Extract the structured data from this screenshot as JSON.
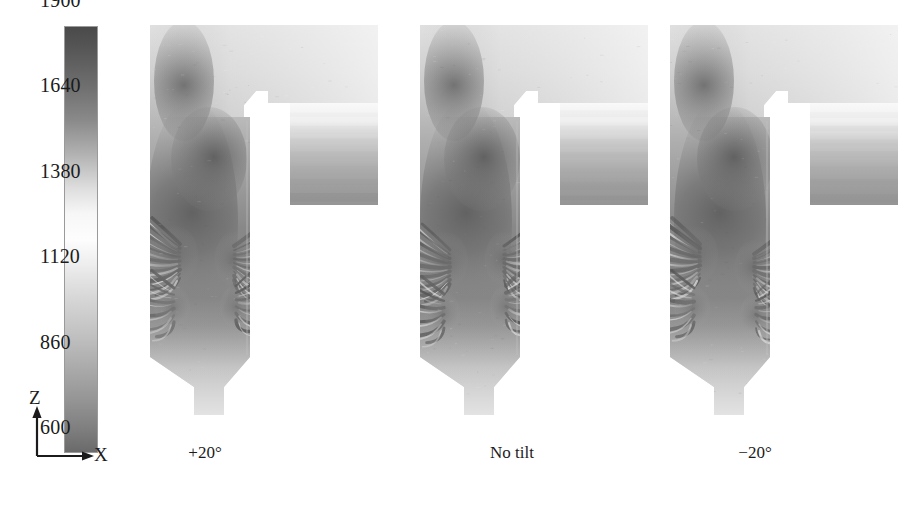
{
  "figure": {
    "type": "cfd-contour-panels",
    "background_color": "#ffffff",
    "text_color": "#1b1b1b"
  },
  "colorbar": {
    "name": "temperature-colorbar",
    "orientation": "vertical",
    "colormap": "grayscale-inverted-banded",
    "min": 600,
    "max": 1900,
    "tick_values": [
      1900,
      1640,
      1380,
      1120,
      860,
      600
    ],
    "tick_labels": [
      "1900",
      "1640",
      "1380",
      "1120",
      "860",
      "600"
    ],
    "stops": [
      {
        "pos": 0.0,
        "color": "#4a4a4a"
      },
      {
        "pos": 0.05,
        "color": "#565656"
      },
      {
        "pos": 0.14,
        "color": "#6f6f6f"
      },
      {
        "pos": 0.22,
        "color": "#8a8a8a"
      },
      {
        "pos": 0.3,
        "color": "#b2b2b2"
      },
      {
        "pos": 0.38,
        "color": "#dedede"
      },
      {
        "pos": 0.44,
        "color": "#f7f7f7"
      },
      {
        "pos": 0.5,
        "color": "#fdfdfd"
      },
      {
        "pos": 0.56,
        "color": "#ededed"
      },
      {
        "pos": 0.64,
        "color": "#d6d6d6"
      },
      {
        "pos": 0.72,
        "color": "#c2c2c2"
      },
      {
        "pos": 0.8,
        "color": "#ababab"
      },
      {
        "pos": 0.88,
        "color": "#949494"
      },
      {
        "pos": 0.95,
        "color": "#7d7d7d"
      },
      {
        "pos": 1.0,
        "color": "#6a6a6a"
      }
    ]
  },
  "axis_triad": {
    "name": "orientation-axes",
    "vertical_label": "Z",
    "horizontal_label": "X"
  },
  "panels": [
    {
      "id": "panel-plus20",
      "caption": "+20°",
      "tilt_degrees": 20,
      "description": "furnace cross-section temperature contour, burner tilted +20 degrees"
    },
    {
      "id": "panel-no-tilt",
      "caption": "No tilt",
      "tilt_degrees": 0,
      "description": "furnace cross-section temperature contour, no burner tilt"
    },
    {
      "id": "panel-minus20",
      "caption": "−20°",
      "tilt_degrees": -20,
      "description": "furnace cross-section temperature contour, burner tilted -20 degrees"
    }
  ],
  "chart_data": {
    "type": "heatmap",
    "title": "",
    "xlabel": "X",
    "ylabel": "Z",
    "colorbar_label": "",
    "colorbar_range": [
      600,
      1900
    ],
    "colorbar_ticks": [
      600,
      860,
      1120,
      1380,
      1640,
      1900
    ],
    "grid": false,
    "legend_position": "left",
    "panels": [
      {
        "name": "+20°",
        "regions": [
          {
            "zone": "upper furnace shaft",
            "approx_value": 1450
          },
          {
            "zone": "burner / flame core",
            "approx_value": 1750
          },
          {
            "zone": "vortex striations lower shaft",
            "approx_value": 1700
          },
          {
            "zone": "hopper taper (bottom)",
            "approx_value": 1400
          },
          {
            "zone": "horizontal pass outlet block",
            "approx_value": 1000
          },
          {
            "zone": "outlet block lower (coolest)",
            "approx_value": 800
          }
        ]
      },
      {
        "name": "No tilt",
        "regions": [
          {
            "zone": "upper furnace shaft",
            "approx_value": 1430
          },
          {
            "zone": "burner / flame core",
            "approx_value": 1720
          },
          {
            "zone": "vortex striations lower shaft",
            "approx_value": 1690
          },
          {
            "zone": "hopper taper (bottom)",
            "approx_value": 1380
          },
          {
            "zone": "horizontal pass outlet block",
            "approx_value": 980
          },
          {
            "zone": "outlet block lower (coolest)",
            "approx_value": 780
          }
        ]
      },
      {
        "name": "−20°",
        "regions": [
          {
            "zone": "upper furnace shaft",
            "approx_value": 1400
          },
          {
            "zone": "burner / flame core",
            "approx_value": 1700
          },
          {
            "zone": "vortex striations lower shaft",
            "approx_value": 1660
          },
          {
            "zone": "hopper taper (bottom)",
            "approx_value": 1360
          },
          {
            "zone": "horizontal pass outlet block",
            "approx_value": 960
          },
          {
            "zone": "outlet block lower (coolest)",
            "approx_value": 760
          }
        ]
      }
    ]
  }
}
